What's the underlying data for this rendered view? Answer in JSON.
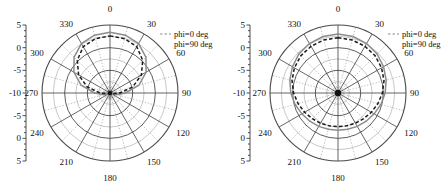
{
  "figure": {
    "type": "polar-radiation-pattern-pair",
    "panels": [
      "left",
      "right"
    ]
  },
  "legend": {
    "entries": [
      {
        "label": "phi=0 deg",
        "style": "dashed-thin",
        "color": "#8c8c8c"
      },
      {
        "label": "phi=90 deg",
        "style": "solid",
        "color": "#1a1a1a"
      }
    ]
  },
  "radial_axis": {
    "tick_labels_top_to_bottom": [
      "5",
      "0",
      "-5",
      "-10",
      "-5",
      "0",
      "5"
    ],
    "center_value": -10,
    "outer_value": 5,
    "minor_tick_count": 3
  },
  "angular_axis": {
    "labels": [
      "0",
      "30",
      "60",
      "90",
      "120",
      "150",
      "180",
      "210",
      "240",
      "270",
      "300",
      "330"
    ],
    "step_deg": 30,
    "spoke_step_deg": 15
  },
  "chart_data": {
    "type": "line",
    "title": "",
    "xlabel": "",
    "ylabel": "",
    "coordinate_system": "polar",
    "rlim": [
      -10,
      5
    ],
    "rticks": [
      -10,
      -5,
      0,
      5
    ],
    "thetalim": [
      0,
      360
    ],
    "thetaticks": [
      0,
      30,
      60,
      90,
      120,
      150,
      180,
      210,
      240,
      270,
      300,
      330
    ],
    "grid": true,
    "legend_position": "upper-right",
    "charts": [
      {
        "panel": "left",
        "series": [
          {
            "name": "phi=0 deg",
            "color": "#8c8c8c",
            "style": "solid",
            "theta_deg": [
              0,
              15,
              30,
              45,
              60,
              75,
              90,
              105,
              120,
              135,
              150,
              165,
              180,
              195,
              210,
              225,
              240,
              255,
              270,
              285,
              300,
              315,
              330,
              345,
              360
            ],
            "r_db": [
              3.4,
              3.2,
              2.6,
              1.2,
              -0.8,
              -3.4,
              -6.6,
              -8.6,
              -9.6,
              -10,
              -9.8,
              -9.2,
              -8.8,
              -9.2,
              -9.8,
              -10,
              -9.6,
              -8.6,
              -6.6,
              -3.4,
              -0.8,
              1.2,
              2.6,
              3.2,
              3.4
            ]
          },
          {
            "name": "phi=90 deg",
            "color": "#1a1a1a",
            "style": "dashed",
            "theta_deg": [
              0,
              15,
              30,
              45,
              60,
              75,
              90,
              105,
              120,
              135,
              150,
              165,
              180,
              195,
              210,
              225,
              240,
              255,
              270,
              285,
              300,
              315,
              330,
              345,
              360
            ],
            "r_db": [
              2.6,
              2.4,
              1.8,
              0.2,
              -2.0,
              -4.8,
              -7.8,
              -9.4,
              -10,
              -10,
              -10,
              -10,
              -10,
              -10,
              -10,
              -10,
              -10,
              -9.4,
              -7.8,
              -4.8,
              -2.0,
              0.2,
              1.8,
              2.4,
              2.6
            ]
          }
        ]
      },
      {
        "panel": "right",
        "series": [
          {
            "name": "phi=0 deg",
            "color": "#8c8c8c",
            "style": "solid",
            "theta_deg": [
              0,
              15,
              30,
              45,
              60,
              75,
              90,
              105,
              120,
              135,
              150,
              165,
              180,
              195,
              210,
              225,
              240,
              255,
              270,
              285,
              300,
              315,
              330,
              345,
              360
            ],
            "r_db": [
              3.0,
              2.9,
              2.6,
              2.2,
              1.6,
              1.0,
              0.4,
              -0.2,
              -0.8,
              -1.2,
              -1.5,
              -1.7,
              -1.8,
              -1.7,
              -1.5,
              -1.2,
              -0.8,
              -0.2,
              0.4,
              1.0,
              1.6,
              2.2,
              2.6,
              2.9,
              3.0
            ]
          },
          {
            "name": "phi=90 deg",
            "color": "#1a1a1a",
            "style": "dashed",
            "theta_deg": [
              0,
              15,
              30,
              45,
              60,
              75,
              90,
              105,
              120,
              135,
              150,
              165,
              180,
              195,
              210,
              225,
              240,
              255,
              270,
              285,
              300,
              315,
              330,
              345,
              360
            ],
            "r_db": [
              2.2,
              2.1,
              1.9,
              1.6,
              1.1,
              0.5,
              -0.2,
              -0.9,
              -1.5,
              -2.0,
              -2.3,
              -2.5,
              -2.6,
              -2.5,
              -2.3,
              -2.0,
              -1.5,
              -0.9,
              -0.2,
              0.5,
              1.1,
              1.6,
              1.9,
              2.1,
              2.2
            ]
          }
        ]
      }
    ]
  }
}
